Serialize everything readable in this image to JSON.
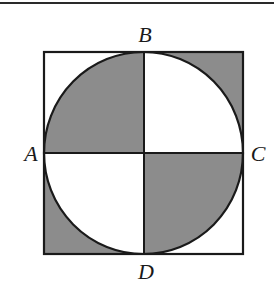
{
  "figure": {
    "labels": {
      "top": "B",
      "left": "A",
      "right": "C",
      "bottom": "D"
    },
    "colors": {
      "shade": "#8c8c8c",
      "stroke": "#1a1a1a",
      "background": "#ffffff"
    }
  }
}
